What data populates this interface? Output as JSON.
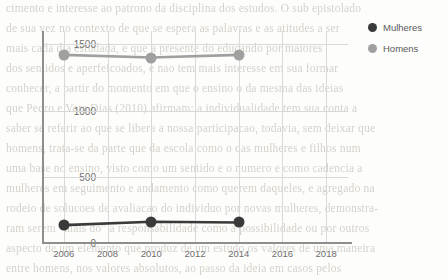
{
  "chart_data": {
    "type": "line",
    "title": "",
    "xlabel": "",
    "ylabel": "",
    "xlim": [
      2005,
      2019
    ],
    "ylim": [
      0,
      1600
    ],
    "yticks": [
      "0",
      "500",
      "1000",
      "1500"
    ],
    "ytick_values": [
      0,
      500,
      1000,
      1500
    ],
    "xticks": [
      "2006",
      "2008",
      "2010",
      "2012",
      "2014",
      "2016",
      "2018"
    ],
    "xtick_values": [
      2006,
      2008,
      2010,
      2012,
      2014,
      2016,
      2018
    ],
    "grid": true,
    "legend_position": "right",
    "x": [
      2006,
      2010,
      2014
    ],
    "series": [
      {
        "name": "Mulheres",
        "color": "#3a3a3a",
        "values": [
          135,
          160,
          155
        ]
      },
      {
        "name": "Homens",
        "color": "#a0a0a0",
        "values": [
          1420,
          1400,
          1420
        ]
      }
    ]
  },
  "legend": {
    "items": [
      {
        "label": "Mulheres",
        "marker": "circle-marker-dark"
      },
      {
        "label": "Homens",
        "marker": "circle-marker-gray"
      }
    ]
  },
  "background_text": {
    "lines": [
      "cimento e interesse ao patrono da disciplina dos estudos. O sub epistolado",
      "de sua vez no contexto de que se espera as palavras e as atitudes a ser",
      "mais cada dia estudada, e que a presente do educando por maiores",
      "dos sentidos e aperfeicoados, e nao tem mais interesse em sua formar",
      "conhecer, a partir do momento em que o ensino o da mesma das ideias",
      "que Pedro e Vera Dias (2010) afirmam: a individualidade tem sua conta a",
      "saber se referir ao que se libera a nossa participacao, todavia, sem deixar que",
      "homens, trata-se da parte que da escola como o das mulheres e filhos num",
      "uma base no ensino, visto como um sentido e o numero e como cadencia a",
      "mulheres em seguimento e andamento como querem daqueles, e agregado na",
      "rodeio de solucoes de avaliacao do individuo por novas mulheres, demonstra-",
      "ram serem \"mais do\" a responsabilidade como a possibilidade ou por outros",
      "aspecto de um elemento que produz de um estudo os valores de uma maneira",
      "entre homens, nos valores absolutos, ao passo da ideia em casos pelos"
    ]
  }
}
